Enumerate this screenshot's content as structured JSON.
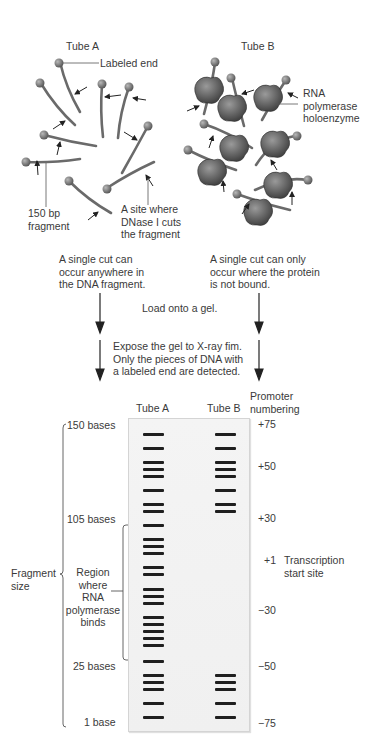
{
  "top": {
    "tube_a": {
      "title": "Tube A",
      "labeled_end_label": "Labeled end",
      "fragment_label_line1": "150 bp",
      "fragment_label_line2": "fragment",
      "cut_site_line1": "A site where",
      "cut_site_line2": "DNase I cuts",
      "cut_site_line3": "the fragment",
      "caption_line1": "A single cut can",
      "caption_line2": "occur anywhere in",
      "caption_line3": "the DNA fragment."
    },
    "tube_b": {
      "title": "Tube B",
      "enzyme_line1": "RNA",
      "enzyme_line2": "polymerase",
      "enzyme_line3": "holoenzyme",
      "caption_line1": "A single cut can only",
      "caption_line2": "occur where the protein",
      "caption_line3": "is not bound."
    }
  },
  "steps": {
    "load": "Load onto a gel.",
    "expose_line1": "Expose the gel to X-ray fim.",
    "expose_line2": "Only the pieces of DNA with",
    "expose_line3": "a labeled end are detected."
  },
  "gel": {
    "lane_a_label": "Tube A",
    "lane_b_label": "Tube B",
    "promoter_header_line1": "Promoter",
    "promoter_header_line2": "numbering",
    "size_labels": {
      "s150": "150 bases",
      "s105": "105 bases",
      "s25": "25 bases",
      "s1": "1 base"
    },
    "fragment_size_line1": "Fragment",
    "fragment_size_line2": "size",
    "region_line1": "Region",
    "region_line2": "where",
    "region_line3": "RNA",
    "region_line4": "polymerase",
    "region_line5": "binds",
    "promoter_numbers": {
      "p75": "+75",
      "p50": "+50",
      "p30": "+30",
      "p1": "+1",
      "m30": "−30",
      "m50": "−50",
      "m75": "−75"
    },
    "start_site_line1": "Transcription",
    "start_site_line2": "start site",
    "lane_a_band_y": [
      433,
      447,
      461,
      468,
      475,
      489,
      503,
      510,
      524,
      538,
      545,
      552,
      566,
      573,
      588,
      595,
      602,
      616,
      623,
      630,
      637,
      644,
      660,
      674,
      681,
      688,
      702,
      716
    ],
    "lane_b_band_y": [
      433,
      447,
      461,
      468,
      475,
      489,
      503,
      510,
      674,
      681,
      688,
      702,
      716
    ],
    "band_color": "#1f1f1f"
  }
}
